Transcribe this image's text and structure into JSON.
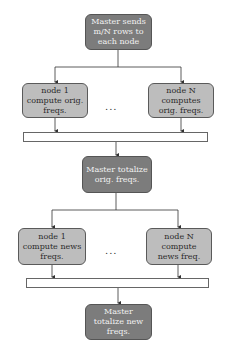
{
  "diagram": {
    "type": "flowchart",
    "steps": {
      "master_send": "Master sends m/N rows to each node",
      "node1_orig": "node 1 compute orig. freqs.",
      "nodeN_orig": "node N computes orig. freqs.",
      "ellipsis_1": "...",
      "master_totalize_orig": "Master totalize orig. freqs.",
      "node1_news": "node 1 compute news freqs.",
      "nodeN_news": "node N compute news freq.",
      "ellipsis_2": "...",
      "master_totalize_new": "Master totalize new freqs."
    },
    "colors": {
      "master_fill": "#7c7c7c",
      "node_fill": "#bdbdbd",
      "border": "#555555",
      "line": "#333333"
    }
  }
}
